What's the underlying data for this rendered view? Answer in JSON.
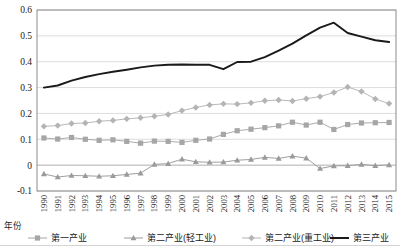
{
  "chart_data": {
    "type": "line",
    "title": "",
    "xlabel": "年份",
    "ylabel": "",
    "ylim": [
      -0.1,
      0.6
    ],
    "yticks": [
      -0.1,
      0,
      0.1,
      0.2,
      0.3,
      0.4,
      0.5,
      0.6
    ],
    "ytick_labels": [
      "-0.1",
      "0",
      "0.1",
      "0.2",
      "0.3",
      "0.4",
      "0.5",
      "0.6"
    ],
    "grid": true,
    "legend_position": "bottom",
    "categories": [
      "1990",
      "1991",
      "1992",
      "1993",
      "1994",
      "1995",
      "1996",
      "1997",
      "1998",
      "1999",
      "2000",
      "2001",
      "2002",
      "2003",
      "2004",
      "2005",
      "2006",
      "2007",
      "2008",
      "2009",
      "2010",
      "2011",
      "2012",
      "2013",
      "2014",
      "2015"
    ],
    "series": [
      {
        "name": "第一产业",
        "marker": "square",
        "color": "#a6a6a6",
        "values": [
          0.105,
          0.101,
          0.107,
          0.1,
          0.096,
          0.098,
          0.092,
          0.085,
          0.093,
          0.092,
          0.088,
          0.096,
          0.101,
          0.119,
          0.133,
          0.139,
          0.145,
          0.152,
          0.166,
          0.155,
          0.166,
          0.138,
          0.157,
          0.163,
          0.164,
          0.165
        ]
      },
      {
        "name": "第二产业(轻工业)",
        "marker": "triangle",
        "color": "#9a9a9a",
        "values": [
          -0.034,
          -0.046,
          -0.04,
          -0.041,
          -0.043,
          -0.041,
          -0.036,
          -0.031,
          0.003,
          0.006,
          0.023,
          0.013,
          0.011,
          0.012,
          0.019,
          0.022,
          0.03,
          0.026,
          0.035,
          0.027,
          -0.013,
          -0.003,
          -0.002,
          0.003,
          -0.002,
          0.001
        ]
      },
      {
        "name": "第二产业(重工业)",
        "marker": "diamond",
        "color": "#b4b4b4",
        "values": [
          0.15,
          0.153,
          0.161,
          0.163,
          0.17,
          0.173,
          0.179,
          0.183,
          0.189,
          0.196,
          0.211,
          0.223,
          0.233,
          0.237,
          0.236,
          0.241,
          0.249,
          0.252,
          0.248,
          0.257,
          0.265,
          0.281,
          0.302,
          0.285,
          0.256,
          0.238
        ]
      },
      {
        "name": "第三产业",
        "marker": "none",
        "color": "#1a1a1a",
        "values": [
          0.3,
          0.308,
          0.327,
          0.341,
          0.352,
          0.361,
          0.369,
          0.378,
          0.385,
          0.388,
          0.389,
          0.388,
          0.388,
          0.371,
          0.399,
          0.4,
          0.418,
          0.443,
          0.47,
          0.502,
          0.532,
          0.551,
          0.511,
          0.497,
          0.483,
          0.476
        ]
      }
    ]
  },
  "legend": {
    "items": [
      {
        "label": "第一产业",
        "marker": "square"
      },
      {
        "label": "第二产业(轻工业)",
        "marker": "triangle"
      },
      {
        "label": "第二产业(重工业)",
        "marker": "diamond"
      },
      {
        "label": "第三产业",
        "marker": "line"
      }
    ]
  }
}
